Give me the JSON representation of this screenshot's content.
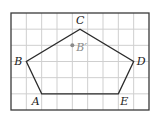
{
  "figure": {
    "grid": {
      "cols": 9,
      "rows": 6,
      "left": 11,
      "top": 13,
      "width": 138,
      "height": 97,
      "line_color": "#cfcfcf",
      "border_color": "#3a3a3a"
    },
    "polygon": {
      "stroke_color": "#2b2b2b",
      "vertices": [
        {
          "name": "A",
          "col": 2,
          "row": 5,
          "label": "A",
          "label_dx": -10,
          "label_dy": 11
        },
        {
          "name": "B",
          "col": 1,
          "row": 3,
          "label": "B",
          "label_dx": -12,
          "label_dy": 3
        },
        {
          "name": "C",
          "col": 4.5,
          "row": 1,
          "label": "C",
          "label_dx": -4,
          "label_dy": -5
        },
        {
          "name": "D",
          "col": 8,
          "row": 3,
          "label": "D",
          "label_dx": 3,
          "label_dy": 3
        },
        {
          "name": "E",
          "col": 7,
          "row": 5,
          "label": "E",
          "label_dx": 2,
          "label_dy": 11
        }
      ]
    },
    "point": {
      "name": "B'",
      "col": 4,
      "row": 2,
      "label": "B′",
      "color": "#8a8a8a",
      "label_dx": 4,
      "label_dy": 6
    }
  }
}
